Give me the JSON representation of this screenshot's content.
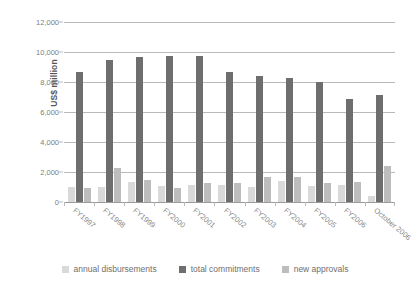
{
  "chart_data": {
    "type": "bar",
    "title": "",
    "xlabel": "",
    "ylabel": "US$ million",
    "ylim": [
      0,
      12000
    ],
    "ytick_step": 2000,
    "yticks": [
      "0",
      "2,000",
      "4,000",
      "6,000",
      "8,000",
      "10,000",
      "12,000"
    ],
    "grid": true,
    "legend_position": "bottom",
    "categories": [
      "FY1997",
      "FY1998",
      "FY1999",
      "FY2000",
      "FY2001",
      "FY2002",
      "FY2003",
      "FY2004",
      "FY2005",
      "FY2006",
      "October 2006"
    ],
    "series": [
      {
        "name": "annual disbursements",
        "color": "#d9d9d9",
        "values": [
          1020,
          1030,
          1340,
          1070,
          1140,
          1150,
          1030,
          1400,
          1080,
          1120,
          380
        ]
      },
      {
        "name": "total commitments",
        "color": "#6e6e6e",
        "values": [
          8700,
          9500,
          9650,
          9750,
          9750,
          8700,
          8400,
          8300,
          8000,
          6900,
          7150
        ]
      },
      {
        "name": "new approvals",
        "color": "#bdbdbd",
        "values": [
          950,
          2250,
          1450,
          960,
          1250,
          1280,
          1700,
          1700,
          1300,
          1340,
          2400
        ]
      }
    ]
  }
}
